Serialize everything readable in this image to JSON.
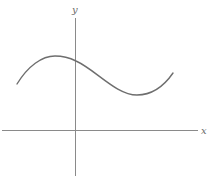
{
  "diagram": {
    "type": "function-graph",
    "axes": {
      "x_label": "x",
      "y_label": "y",
      "color": "#8a8a8a"
    },
    "curve": {
      "description": "smooth cubic-like wave: rises from left to a local maximum left of the y-axis, crosses y-axis descending, reaches a local minimum right of the y-axis, then rises at the right end; entirely above the x-axis",
      "color": "#6e6e6e",
      "points_px": [
        [
          17,
          84
        ],
        [
          55,
          56
        ],
        [
          76,
          62
        ],
        [
          137,
          95
        ],
        [
          173,
          73
        ]
      ]
    }
  }
}
